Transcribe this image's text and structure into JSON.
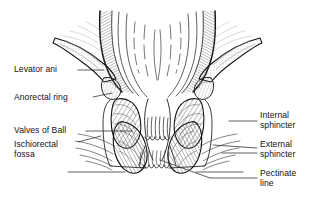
{
  "figure": {
    "type": "anatomical-line-drawing",
    "background_color": "#ffffff",
    "line_color": "#1a1a1a",
    "hatch_color": "#555555",
    "tone_color": "#c9c9c9"
  },
  "labels": {
    "levator_ani": "Levator ani",
    "anorectal_ring": "Anorectal ring",
    "valves_of_ball": "Valves of Ball",
    "ischiorectal_fossa_line1": "Ischiorectal",
    "ischiorectal_fossa_line2": "fossa",
    "internal_sphincter_line1": "Internal",
    "internal_sphincter_line2": "sphincter",
    "external_sphincter_line1": "External",
    "external_sphincter_line2": "sphincter",
    "pectinate_line_line1": "Pectinate",
    "pectinate_line_line2": "line"
  },
  "structures": [
    {
      "name": "levator-ani",
      "side": "both",
      "description": "thin tapering muscle sheet sloping outward from rectal wall"
    },
    {
      "name": "anorectal-ring",
      "side": "both",
      "description": "small nodular mass at junction of levator ani and sphincter"
    },
    {
      "name": "internal-sphincter",
      "side": "both",
      "description": "inner oval hatched muscle mass flanking anal canal"
    },
    {
      "name": "external-sphincter",
      "side": "both",
      "description": "outer curved hatched muscle band below internal sphincter"
    },
    {
      "name": "ischiorectal-fossa",
      "side": "both",
      "description": "fan of fine radiating fat striations lateral to sphincters"
    },
    {
      "name": "valves-of-ball",
      "side": "both",
      "description": "mucosal folds at mid anal canal"
    },
    {
      "name": "pectinate-line",
      "side": "center",
      "description": "scalloped dentate junction across anal canal"
    },
    {
      "name": "anal-columns",
      "side": "center",
      "description": "vertical mucosal pleats of the anal canal"
    },
    {
      "name": "rectal-wall",
      "side": "both",
      "description": "hatched rectal wall flaring superiorly"
    },
    {
      "name": "rectal-mucosa-folds",
      "side": "center",
      "description": "longitudinal mucosal fold lines within rectal lumen"
    }
  ]
}
